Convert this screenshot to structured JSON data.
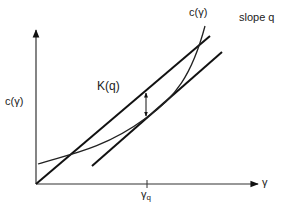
{
  "diagram": {
    "labels": {
      "y_axis": "c(γ)",
      "curve": "c(γ)",
      "slope": "slope q",
      "gap": "K(q)",
      "x_axis": "γ",
      "tick_symbol": "γ",
      "tick_subscript": "q"
    },
    "colors": {
      "line": "#111111",
      "axis": "#333333",
      "curve": "#222222",
      "background": "#ffffff"
    },
    "elements": {
      "upper_line": {
        "x1": 36,
        "y1": 184,
        "x2": 210,
        "y2": 36
      },
      "tangent_line": {
        "x1": 92,
        "y1": 166,
        "x2": 222,
        "y2": 52
      },
      "curve_path": "M38,164 C60,156 100,152 146,118 C175,98 192,75 205,26",
      "k_arrow": {
        "x": 146,
        "y_top": 91,
        "y_bottom": 118
      },
      "tick_x": 147
    }
  }
}
